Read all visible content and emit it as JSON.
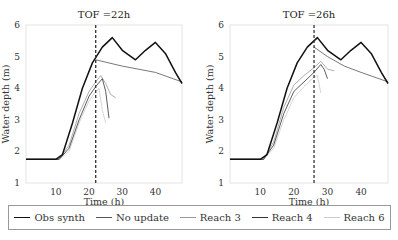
{
  "chart_data": [
    {
      "type": "line",
      "title": "TOF =22h",
      "xlabel": "Time (h)",
      "ylabel": "Water depth (m)",
      "xlim": [
        1,
        48
      ],
      "ylim": [
        1,
        6
      ],
      "xticks": [
        10,
        20,
        30,
        40
      ],
      "yticks": [
        1,
        2,
        3,
        4,
        5,
        6
      ],
      "vline_x": 22,
      "series": [
        {
          "name": "Obs synth",
          "x": [
            1,
            10,
            12,
            15,
            18,
            21,
            24,
            27,
            30,
            34,
            37,
            40,
            43,
            46,
            48
          ],
          "y": [
            1.75,
            1.75,
            1.9,
            2.9,
            4.0,
            4.8,
            5.3,
            5.6,
            5.2,
            4.9,
            5.2,
            5.45,
            5.1,
            4.5,
            4.15
          ]
        },
        {
          "name": "No update",
          "x": [
            22,
            30,
            40,
            48
          ],
          "y": [
            4.9,
            4.7,
            4.5,
            4.2
          ]
        },
        {
          "name": "Reach 3",
          "x": [
            1,
            11,
            14,
            17,
            20,
            22,
            23.5,
            25,
            26.5,
            28
          ],
          "y": [
            1.75,
            1.75,
            2.2,
            3.2,
            3.9,
            4.2,
            4.4,
            4.15,
            3.8,
            3.7
          ]
        },
        {
          "name": "Reach 4",
          "x": [
            1,
            11,
            14,
            17,
            20,
            22,
            24,
            25,
            26
          ],
          "y": [
            1.75,
            1.75,
            2.1,
            3.0,
            3.75,
            4.05,
            4.3,
            3.9,
            3.05
          ]
        },
        {
          "name": "Reach 6",
          "x": [
            1,
            11,
            14,
            17,
            20,
            22,
            23,
            24,
            25
          ],
          "y": [
            1.75,
            1.75,
            2.0,
            2.9,
            3.6,
            3.9,
            4.0,
            3.3,
            2.9
          ]
        }
      ]
    },
    {
      "type": "line",
      "title": "TOF =26h",
      "xlabel": "Time (h)",
      "ylabel": "Water depth (m)",
      "xlim": [
        1,
        48
      ],
      "ylim": [
        1,
        6
      ],
      "xticks": [
        10,
        20,
        30,
        40
      ],
      "yticks": [
        1,
        2,
        3,
        4,
        5,
        6
      ],
      "vline_x": 26,
      "series": [
        {
          "name": "Obs synth",
          "x": [
            1,
            10,
            12,
            15,
            18,
            21,
            24,
            27,
            30,
            34,
            37,
            40,
            43,
            46,
            48
          ],
          "y": [
            1.75,
            1.75,
            1.9,
            2.9,
            4.0,
            4.8,
            5.3,
            5.6,
            5.2,
            4.9,
            5.2,
            5.45,
            5.1,
            4.5,
            4.15
          ]
        },
        {
          "name": "No update",
          "x": [
            26,
            30,
            35,
            40,
            48
          ],
          "y": [
            5.3,
            5.0,
            4.7,
            4.5,
            4.2
          ]
        },
        {
          "name": "Reach 3",
          "x": [
            1,
            11,
            14,
            17,
            20,
            23,
            26,
            28,
            30,
            32
          ],
          "y": [
            1.75,
            1.75,
            2.3,
            3.4,
            4.1,
            4.4,
            4.65,
            4.85,
            4.6,
            4.55
          ]
        },
        {
          "name": "Reach 4",
          "x": [
            1,
            11,
            14,
            17,
            20,
            23,
            26,
            28,
            29,
            30
          ],
          "y": [
            1.75,
            1.75,
            2.2,
            3.2,
            3.9,
            4.2,
            4.5,
            4.75,
            4.6,
            4.3
          ]
        },
        {
          "name": "Reach 6",
          "x": [
            1,
            11,
            14,
            17,
            20,
            23,
            26,
            27,
            28
          ],
          "y": [
            1.75,
            1.75,
            2.1,
            3.0,
            3.7,
            4.05,
            4.35,
            4.4,
            3.85
          ]
        }
      ]
    }
  ],
  "panels": [
    {
      "title": "TOF =22h",
      "xlabel": "Time (h)",
      "ylabel": "Water depth (m)"
    },
    {
      "title": "TOF =26h",
      "xlabel": "Time (h)",
      "ylabel": "Water depth (m)"
    }
  ],
  "legend": [
    {
      "label": "Obs synth",
      "color": "#111111"
    },
    {
      "label": "No update",
      "color": "#555555"
    },
    {
      "label": "Reach 3",
      "color": "#999999"
    },
    {
      "label": "Reach 4",
      "color": "#333333"
    },
    {
      "label": "Reach 6",
      "color": "#cccccc"
    }
  ]
}
